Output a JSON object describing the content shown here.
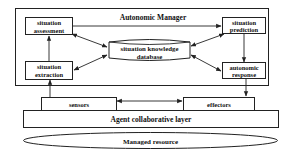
{
  "diagram": {
    "manager": {
      "title": "Autonomic Manager"
    },
    "nodes": {
      "assessment": {
        "line1": "situation",
        "line2": "assessment"
      },
      "prediction": {
        "line1": "situation",
        "line2": "prediction"
      },
      "extraction": {
        "line1": "situation",
        "line2": "extraction"
      },
      "response": {
        "line1": "autonomic",
        "line2": "response"
      },
      "database": {
        "line1": "situation knowledge",
        "line2": "database"
      },
      "sensors": {
        "label": "sensors"
      },
      "effectors": {
        "label": "effectors"
      },
      "agent_layer": {
        "label": "Agent collaborative layer"
      },
      "managed_resource": {
        "label": "Managed resource"
      }
    },
    "edges": [
      {
        "from": "extraction",
        "to": "assessment",
        "direction": "forward"
      },
      {
        "from": "assessment",
        "to": "prediction",
        "direction": "forward"
      },
      {
        "from": "prediction",
        "to": "response",
        "direction": "forward"
      },
      {
        "from": "assessment",
        "to": "database",
        "direction": "both"
      },
      {
        "from": "extraction",
        "to": "database",
        "direction": "both"
      },
      {
        "from": "prediction",
        "to": "database",
        "direction": "both"
      },
      {
        "from": "response",
        "to": "database",
        "direction": "both"
      },
      {
        "from": "sensors",
        "to": "extraction",
        "direction": "forward"
      },
      {
        "from": "response",
        "to": "effectors",
        "direction": "forward"
      },
      {
        "from": "sensors",
        "to": "effectors",
        "direction": "both"
      }
    ]
  }
}
